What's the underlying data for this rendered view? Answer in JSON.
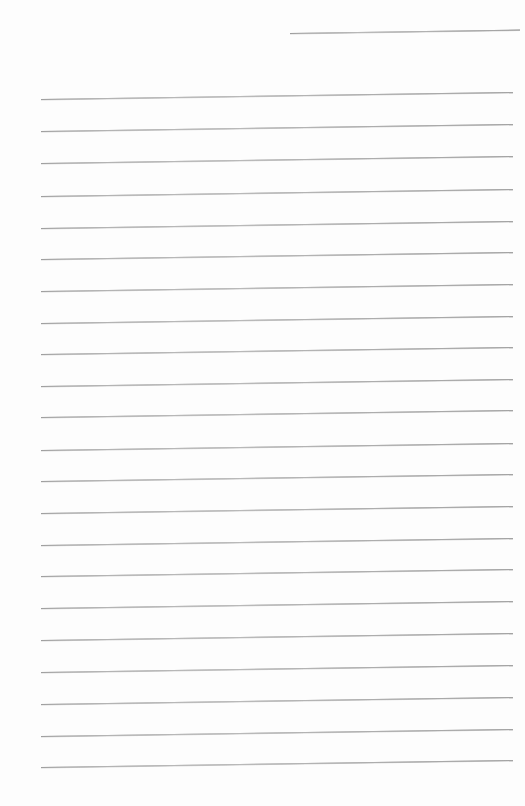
{
  "document": {
    "type": "ruled-notepad-page",
    "title": "Blank Ruled Writing Paper",
    "description": "Scanned blank lined notepad page with no written content",
    "page_width": 525,
    "page_height": 806,
    "background_color": "#fdfdfd",
    "rule_color": "#b4b4b4",
    "content_text": "",
    "has_text": false,
    "has_margin_rule": false,
    "scan_skew_degrees": -0.85
  },
  "ruling": {
    "line_count_total": 23,
    "full_line_count": 22,
    "partial_line_count": 1,
    "line_spacing_px": 31.8,
    "line_thickness_px": 1,
    "left_margin_px": 41,
    "right_margin_px": 513,
    "first_full_line_y": 99,
    "last_full_line_y": 767,
    "lines": [
      {
        "index": 0,
        "kind": "partial",
        "x": 290,
        "y": 33,
        "width": 230
      },
      {
        "index": 1,
        "kind": "full",
        "x": 41,
        "y": 99,
        "width": 472
      },
      {
        "index": 2,
        "kind": "full",
        "x": 41,
        "y": 131,
        "width": 472
      },
      {
        "index": 3,
        "kind": "full",
        "x": 41,
        "y": 163,
        "width": 472
      },
      {
        "index": 4,
        "kind": "full",
        "x": 41,
        "y": 196,
        "width": 472
      },
      {
        "index": 5,
        "kind": "full",
        "x": 41,
        "y": 228,
        "width": 472
      },
      {
        "index": 6,
        "kind": "full",
        "x": 41,
        "y": 259,
        "width": 472
      },
      {
        "index": 7,
        "kind": "full",
        "x": 41,
        "y": 291,
        "width": 472
      },
      {
        "index": 8,
        "kind": "full",
        "x": 41,
        "y": 323,
        "width": 472
      },
      {
        "index": 9,
        "kind": "full",
        "x": 41,
        "y": 354,
        "width": 472
      },
      {
        "index": 10,
        "kind": "full",
        "x": 41,
        "y": 386,
        "width": 472
      },
      {
        "index": 11,
        "kind": "full",
        "x": 41,
        "y": 417,
        "width": 472
      },
      {
        "index": 12,
        "kind": "full",
        "x": 41,
        "y": 450,
        "width": 472
      },
      {
        "index": 13,
        "kind": "full",
        "x": 41,
        "y": 481,
        "width": 472
      },
      {
        "index": 14,
        "kind": "full",
        "x": 41,
        "y": 513,
        "width": 472
      },
      {
        "index": 15,
        "kind": "full",
        "x": 41,
        "y": 545,
        "width": 472
      },
      {
        "index": 16,
        "kind": "full",
        "x": 41,
        "y": 576,
        "width": 472
      },
      {
        "index": 17,
        "kind": "full",
        "x": 41,
        "y": 608,
        "width": 472
      },
      {
        "index": 18,
        "kind": "full",
        "x": 41,
        "y": 640,
        "width": 472
      },
      {
        "index": 19,
        "kind": "full",
        "x": 41,
        "y": 672,
        "width": 472
      },
      {
        "index": 20,
        "kind": "full",
        "x": 41,
        "y": 704,
        "width": 472
      },
      {
        "index": 21,
        "kind": "full",
        "x": 41,
        "y": 736,
        "width": 472
      },
      {
        "index": 22,
        "kind": "full",
        "x": 41,
        "y": 767,
        "width": 472
      }
    ]
  }
}
